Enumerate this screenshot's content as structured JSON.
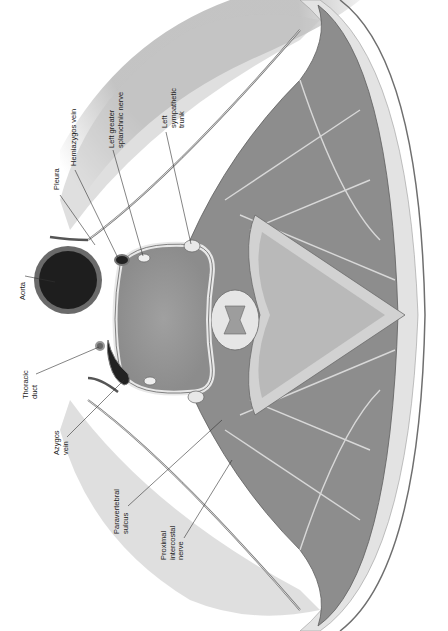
{
  "figure": {
    "orientation": "rotated -90deg",
    "colors": {
      "background": "#ffffff",
      "lung": "#c9c9c9",
      "muscle": "#8a8a8a",
      "vertebral_body": "#9a9a9a",
      "aorta_lumen": "#1e1e1e",
      "aorta_wall": "#6a6a6a",
      "fat": "#e2e2e2",
      "skin_edge": "#6f6f6f",
      "label_text": "#222222",
      "leader_line": "#333333"
    }
  },
  "labels": [
    {
      "id": "aorta",
      "text": "Aorta",
      "x": 19,
      "y": 300
    },
    {
      "id": "pleura",
      "text": "Pleura",
      "x": 53,
      "y": 190
    },
    {
      "id": "hemiazygos-vein",
      "text": "Hemiazygos vein",
      "x": 70,
      "y": 166
    },
    {
      "id": "left-greater-splanchnic-nerve",
      "text": "Left greater\nsplanchnic nerve",
      "x": 108,
      "y": 148
    },
    {
      "id": "left-sympathetic-trunk",
      "text": "Left\nsympathetic\ntrunk",
      "x": 161,
      "y": 128
    },
    {
      "id": "thoracic-duct",
      "text": "Thoracic\nduct",
      "x": 22,
      "y": 399
    },
    {
      "id": "azygos-vein",
      "text": "Azygos\nvein",
      "x": 53,
      "y": 455
    },
    {
      "id": "paravertebral-sulcus",
      "text": "Paravertebral\nsulcus",
      "x": 113,
      "y": 534
    },
    {
      "id": "proximal-intercostal-nerve",
      "text": "Proximal\nintercostal\nnerve",
      "x": 160,
      "y": 560
    }
  ]
}
